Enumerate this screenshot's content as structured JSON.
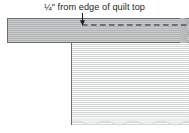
{
  "figure": {
    "type": "sewing-diagram",
    "caption": "¼\" from edge of quilt top",
    "colors": {
      "background": "#ffffff",
      "binding_strip_fill": "#b9bcbd",
      "quilt_top_fill": "#eceded",
      "outline": "#6d6e70",
      "stitch_line": "#231f20",
      "caption_text": "#231f20"
    },
    "parts": {
      "binding_strip": "binding-strip",
      "quilt_top": "quilt-top",
      "stitch_line": "stitch-line",
      "pointer_arrow": "pointer-arrow",
      "quilt_top_left_edge": "quilt-top-left-edge",
      "binding_strip_right_raw_edge": "binding-strip-right-edge",
      "quilt_top_bottom_raw_edge": "quilt-top-bottom-edge"
    },
    "measurement": {
      "value": "¼\"",
      "reference": "edge of quilt top"
    }
  }
}
